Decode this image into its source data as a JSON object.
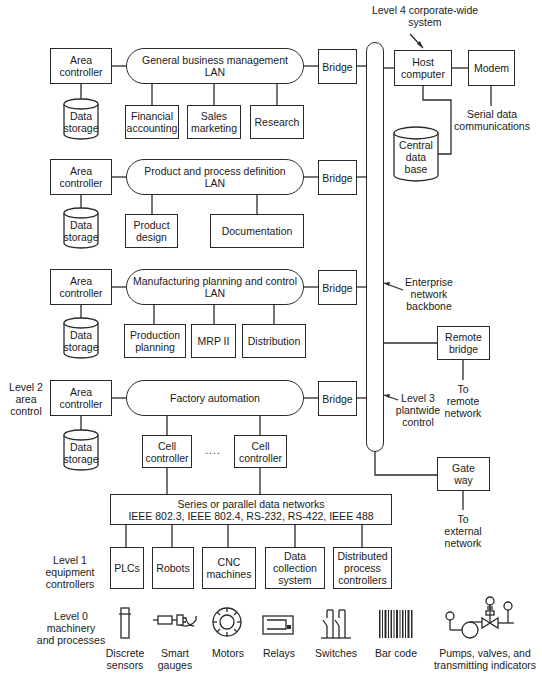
{
  "diagram": {
    "type": "hierarchical network architecture",
    "level_labels": {
      "level4": "Level 4 corporate-wide\nsystem",
      "level3": "Level 3\nplantwide\ncontrol",
      "level2": "Level 2\narea\ncontrol",
      "level1": "Level 1\nequipment\ncontrollers",
      "level0": "Level 0\nmachinery\nand processes"
    },
    "backbone_label": "Enterprise\nnetwork\nbackbone",
    "corporate": {
      "host": "Host\ncomputer",
      "modem": "Modem",
      "serial": "Serial data\ncommunications",
      "central_db": "Central\ndata\nbase"
    },
    "remote_bridge": {
      "box": "Remote\nbridge",
      "target": "To\nremote\nnetwork"
    },
    "gateway": {
      "box": "Gate\nway",
      "target": "To\nexternal\nnetwork"
    },
    "areas": [
      {
        "controller": "Area\ncontroller",
        "storage": "Data\nstorage",
        "lan": "General business management\nLAN",
        "bridge": "Bridge",
        "nodes": [
          "Financial\naccounting",
          "Sales\nmarketing",
          "Research"
        ]
      },
      {
        "controller": "Area\ncontroller",
        "storage": "Data\nstorage",
        "lan": "Product and process definition\nLAN",
        "bridge": "Bridge",
        "nodes": [
          "Product\ndesign",
          "Documentation"
        ]
      },
      {
        "controller": "Area\ncontroller",
        "storage": "Data\nstorage",
        "lan": "Manufacturing planning and control\nLAN",
        "bridge": "Bridge",
        "nodes": [
          "Production\nplanning",
          "MRP II",
          "Distribution"
        ]
      },
      {
        "controller": "Area\ncontroller",
        "storage": "Data\nstorage",
        "lan": "Factory automation",
        "bridge": "Bridge",
        "nodes": [
          "Cell\ncontroller",
          "Cell\ncontroller"
        ],
        "ellipsis": "...."
      }
    ],
    "field_network": "Series or parallel data networks\nIEEE 802.3, IEEE 802.4, RS-232, RS-422, IEEE 488",
    "equipment": [
      "PLCs",
      "Robots",
      "CNC\nmachines",
      "Data\ncollection\nsystem",
      "Distributed\nprocess\ncontrollers"
    ],
    "devices": [
      {
        "icon": "discrete-sensor-icon",
        "label": "Discrete\nsensors"
      },
      {
        "icon": "smart-gauge-icon",
        "label": "Smart\ngauges"
      },
      {
        "icon": "motor-icon",
        "label": "Motors"
      },
      {
        "icon": "relay-icon",
        "label": "Relays"
      },
      {
        "icon": "switch-icon",
        "label": "Switches"
      },
      {
        "icon": "barcode-icon",
        "label": "Bar code"
      },
      {
        "icon": "pump-valve-icon",
        "label": "Pumps, valves, and\ntransmitting indicators"
      }
    ]
  }
}
